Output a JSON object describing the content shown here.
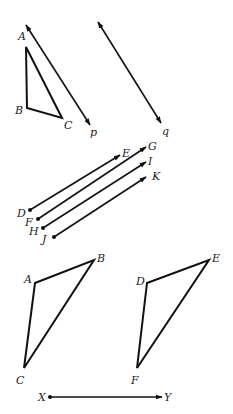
{
  "figure": {
    "background": "#ffffff",
    "ink": "#111111",
    "labels": {
      "top_triangle": {
        "A": "A",
        "B": "B",
        "C": "C"
      },
      "line_p": "p",
      "line_q": "q",
      "parallel_rays": {
        "D": "D",
        "E": "E",
        "F": "F",
        "G": "G",
        "H": "H",
        "I": "I",
        "J": "J",
        "K": "K"
      },
      "bottom_left_triangle": {
        "A": "A",
        "B": "B",
        "C": "C"
      },
      "bottom_right_triangle": {
        "D": "D",
        "E": "E",
        "F": "F"
      },
      "segment": {
        "X": "X",
        "Y": "Y"
      }
    },
    "elements": [
      {
        "type": "line",
        "name": "p",
        "double_arrow": true
      },
      {
        "type": "triangle",
        "vertices": [
          "A",
          "B",
          "C"
        ]
      },
      {
        "type": "line",
        "name": "q",
        "double_arrow": true
      },
      {
        "type": "ray",
        "from": "D",
        "to": "E"
      },
      {
        "type": "ray",
        "from": "F",
        "to": "G"
      },
      {
        "type": "ray",
        "from": "H",
        "to": "I"
      },
      {
        "type": "ray",
        "from": "J",
        "to": "K"
      },
      {
        "type": "triangle",
        "vertices": [
          "A",
          "B",
          "C"
        ]
      },
      {
        "type": "triangle",
        "vertices": [
          "D",
          "E",
          "F"
        ]
      },
      {
        "type": "ray",
        "from": "X",
        "to": "Y"
      }
    ]
  }
}
